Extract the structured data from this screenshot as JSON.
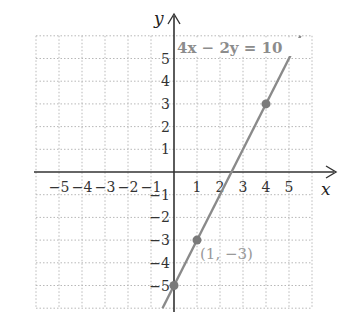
{
  "chart_data": {
    "type": "line",
    "title": "",
    "equation_label": "4x − 2y = 10",
    "xlabel": "x",
    "ylabel": "y",
    "xlim": [
      -6,
      6
    ],
    "ylim": [
      -6,
      6
    ],
    "grid": true,
    "x_ticks": [
      -5,
      -4,
      -3,
      -2,
      -1,
      1,
      2,
      3,
      4,
      5
    ],
    "y_ticks": [
      5,
      4,
      3,
      2,
      1,
      -1,
      -2,
      -3,
      -4,
      -5
    ],
    "x_tick_labels": [
      "−5",
      "−4",
      "−3",
      "−2",
      "−1",
      "1",
      "2",
      "3",
      "4",
      "5"
    ],
    "y_tick_labels": [
      "5",
      "4",
      "3",
      "2",
      "1",
      "−1",
      "−2",
      "−3",
      "−4",
      "−5"
    ],
    "series": [
      {
        "name": "4x − 2y = 10",
        "slope": 2,
        "intercept": -5,
        "x": [
          -0.5,
          5.5
        ],
        "y": [
          -6,
          6
        ],
        "color": "#8a8a8a"
      }
    ],
    "points": [
      {
        "x": 0,
        "y": -5,
        "label": ""
      },
      {
        "x": 1,
        "y": -3,
        "label": "(1, −3)"
      },
      {
        "x": 4,
        "y": 3,
        "label": ""
      }
    ],
    "annotations": [
      "4x − 2y = 10",
      "(1, −3)"
    ]
  },
  "colors": {
    "grid": "#b8b8b8",
    "axis": "#333333",
    "line": "#8a8a8a",
    "point": "#7a7a7a",
    "label_gray": "#9a9a9a"
  }
}
